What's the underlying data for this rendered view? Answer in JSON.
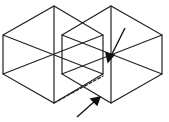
{
  "figure": {
    "stroke_color": "#222222",
    "background": "#ffffff",
    "cube_left": {
      "top": [
        54,
        6
      ],
      "ul": [
        3,
        35
      ],
      "ll": [
        3,
        74
      ],
      "bottom": [
        54,
        103
      ],
      "lr": [
        103,
        74
      ],
      "ur": [
        103,
        35
      ],
      "back": [
        54,
        46
      ]
    },
    "cube_right": {
      "top": [
        111,
        6
      ],
      "ul": [
        62,
        35
      ],
      "ll": [
        62,
        74
      ],
      "bottom": [
        111,
        103
      ],
      "lr": [
        162,
        74
      ],
      "ur": [
        162,
        35
      ],
      "back": [
        111,
        46
      ]
    },
    "arrows": [
      {
        "from": [
          125,
          28
        ],
        "to": [
          109,
          60
        ]
      },
      {
        "from": [
          77,
          117
        ],
        "to": [
          99,
          98
        ]
      }
    ]
  }
}
